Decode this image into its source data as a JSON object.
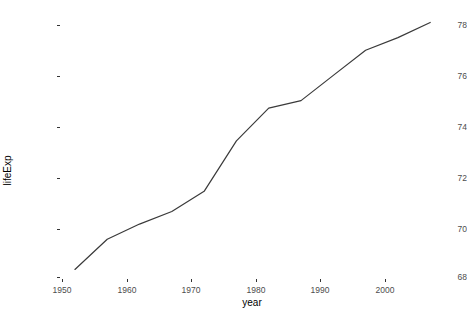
{
  "chart_data": {
    "type": "line",
    "title": "",
    "subtitle": "",
    "xlabel": "year",
    "ylabel": "lifeExp",
    "x": [
      1952,
      1957,
      1962,
      1967,
      1972,
      1977,
      1982,
      1987,
      1992,
      1997,
      2002,
      2007
    ],
    "values": [
      68.3,
      69.5,
      70.1,
      70.6,
      71.4,
      73.4,
      74.7,
      75.0,
      76.0,
      77.0,
      77.5,
      78.1
    ],
    "series": [
      {
        "name": "lifeExp",
        "values": [
          68.3,
          69.5,
          70.1,
          70.6,
          71.4,
          73.4,
          74.7,
          75.0,
          76.0,
          77.0,
          77.5,
          78.1
        ]
      }
    ],
    "xlim": [
      1950.5,
      2008.5
    ],
    "ylim": [
      68.0,
      78.3
    ],
    "x_ticks": [
      1950,
      1960,
      1970,
      1980,
      1990,
      2000
    ],
    "x_tick_labels": [
      "1950",
      "1960",
      "1970",
      "1980",
      "1990",
      "2000"
    ],
    "y_ticks": [
      68,
      70,
      72,
      74,
      76,
      78
    ],
    "y_tick_labels": [
      "68",
      "70",
      "72",
      "74",
      "76",
      "78"
    ],
    "grid": false,
    "legend": "none",
    "line_color": "#3a3a3a",
    "line_width": 1.2,
    "background": "#ffffff",
    "tick_label_color": "#4d4d4d",
    "axis_title_color": "#000000"
  }
}
